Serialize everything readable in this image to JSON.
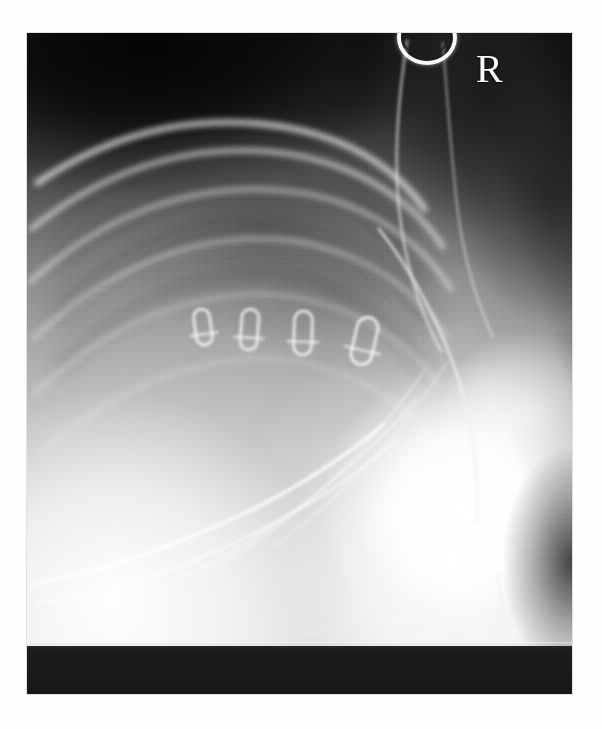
{
  "document": {
    "kind": "radiograph",
    "modality": "X-ray",
    "view": "lateral thoracic",
    "background_color": "#ffffff"
  },
  "film": {
    "left": 27,
    "top": 33,
    "width": 545,
    "height": 661,
    "base_color": "#8d8d8d",
    "dark_band_color": "#1a1a1a",
    "dark_band_height": 48
  },
  "markers": {
    "laterality": {
      "label": "R",
      "meaning": "right",
      "color": "#fdfdfd",
      "x": 449,
      "y": 16,
      "font_size": 40
    },
    "collar_ring": {
      "name": "metallic collar ring",
      "color": "#ffffff",
      "x": 370,
      "y": -22,
      "width": 52,
      "height": 46
    }
  },
  "surgical_clips": {
    "count": 4,
    "color": "#ffffff",
    "description": "radiopaque loop-shaped surgical clips in a horizontal row",
    "items": [
      {
        "index": 1,
        "x": 168,
        "y": 276,
        "width": 16,
        "height": 36,
        "rotation": -8
      },
      {
        "index": 2,
        "x": 214,
        "y": 276,
        "width": 17,
        "height": 41,
        "rotation": 4
      },
      {
        "index": 3,
        "x": 267,
        "y": 278,
        "width": 18,
        "height": 44,
        "rotation": 2
      },
      {
        "index": 4,
        "x": 327,
        "y": 284,
        "width": 21,
        "height": 48,
        "rotation": 13
      }
    ]
  },
  "anatomy": {
    "regions": [
      {
        "name": "air-background-upper-left",
        "tone": "dark"
      },
      {
        "name": "lung-field",
        "tone": "mid-dark"
      },
      {
        "name": "rib-cage",
        "tone": "bright-arcs"
      },
      {
        "name": "cervical-soft-tissue-column",
        "tone": "mid"
      },
      {
        "name": "shoulder-forelimb-mass",
        "tone": "very-bright"
      },
      {
        "name": "sternum-costal-cartilage",
        "tone": "bright-lines"
      },
      {
        "name": "collimation-band-bottom",
        "tone": "black"
      }
    ],
    "rib_arcs": [
      {
        "index": 1,
        "d": "M 10,150 C 90,96 178,78 268,96 C 330,109 372,140 398,176",
        "width": 5.2,
        "opacity": 0.86
      },
      {
        "index": 2,
        "d": "M 4,196 C 86,130 182,104 278,124 C 344,139 390,174 416,214",
        "width": 4.6,
        "opacity": 0.72
      },
      {
        "index": 3,
        "d": "M 2,250 C 80,178 176,144 276,160 C 348,173 396,212 424,256",
        "width": 4.2,
        "opacity": 0.6
      },
      {
        "index": 4,
        "d": "M 6,306 C 78,236 170,196 268,208 C 342,220 392,260 420,304",
        "width": 3.8,
        "opacity": 0.5
      },
      {
        "index": 5,
        "d": "M 8,360 C 74,296 162,254 256,262 C 330,272 382,310 410,350",
        "width": 3.4,
        "opacity": 0.4
      },
      {
        "index": 6,
        "d": "M 14,420 C 76,364 158,322 248,326 C 320,332 372,366 402,402",
        "width": 3.0,
        "opacity": 0.32
      }
    ],
    "rib_shadows": [
      {
        "index": 1,
        "d": "M 44,168 C 110,124 190,110 264,128 C 318,142 356,172 380,204",
        "width": 22,
        "opacity": 0.3
      },
      {
        "index": 2,
        "d": "M 38,222 C 106,164 192,142 272,158 C 330,172 372,206 396,242",
        "width": 21,
        "opacity": 0.26
      },
      {
        "index": 3,
        "d": "M 34,276 C 100,212 186,180 268,194 C 330,208 374,244 398,284",
        "width": 20,
        "opacity": 0.22
      },
      {
        "index": 4,
        "d": "M 32,332 C 96,268 180,230 262,242 C 326,254 370,292 394,330",
        "width": 18,
        "opacity": 0.18
      }
    ],
    "sternal_lines": [
      {
        "index": 1,
        "d": "M 4,552 C 70,540 150,512 218,480 C 272,454 318,424 356,392",
        "width": 3.6,
        "opacity": 0.78
      },
      {
        "index": 2,
        "d": "M 10,570 C 84,562 160,534 228,500 C 284,472 330,442 368,408",
        "width": 3.0,
        "opacity": 0.58
      },
      {
        "index": 3,
        "d": "M 120,560 C 180,536 238,502 288,462 C 328,430 362,398 390,366",
        "width": 2.6,
        "opacity": 0.46
      },
      {
        "index": 4,
        "d": "M 188,536 C 238,506 284,470 322,430 C 352,398 376,368 396,340",
        "width": 2.2,
        "opacity": 0.38
      },
      {
        "index": 5,
        "d": "M 246,514 C 290,482 328,448 360,410 C 384,382 404,354 420,330",
        "width": 2.0,
        "opacity": 0.32
      }
    ],
    "soft_tissue_edges": [
      {
        "name": "cervical-ventral-border",
        "d": "M 380,8 C 372,60 366,118 372,176 C 378,230 392,278 414,318",
        "width": 3.2,
        "opacity": 0.52
      },
      {
        "name": "cervical-dorsal-border",
        "d": "M 416,10 C 420,64 424,120 430,172 C 436,222 448,266 466,304",
        "width": 2.6,
        "opacity": 0.4
      },
      {
        "name": "scapular-border",
        "d": "M 352,196 C 386,240 414,292 432,348 C 446,394 452,442 450,488",
        "width": 3.4,
        "opacity": 0.62
      },
      {
        "name": "humeral-caudal-border",
        "d": "M 470,540 C 478,574 476,600 458,618 C 440,634 414,640 390,634",
        "width": 3.2,
        "opacity": 0.7
      },
      {
        "name": "diaphragm-line",
        "d": "M 276,600 C 330,596 386,596 440,602",
        "width": 2.4,
        "opacity": 0.44
      }
    ]
  }
}
